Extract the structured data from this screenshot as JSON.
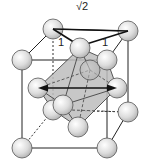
{
  "diagram": {
    "labels": {
      "diagonal": "√2",
      "edge_left": "1",
      "edge_right": "1"
    },
    "colors": {
      "sphere_fill": "#e4e4e4",
      "sphere_stroke": "#555555",
      "octahedron_fill": "#b8b8b8",
      "edge_stroke": "#222222"
    }
  }
}
